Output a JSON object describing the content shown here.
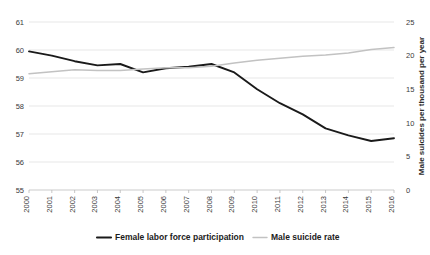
{
  "chart_data": {
    "type": "line",
    "title": "",
    "xlabel": "",
    "ylabel": "",
    "y2label": "Male suicides per thousand per year",
    "grid": true,
    "legend_position": "bottom",
    "categories": [
      "2000",
      "2001",
      "2002",
      "2003",
      "2004",
      "2005",
      "2006",
      "2007",
      "2008",
      "2009",
      "2010",
      "2011",
      "2012",
      "2013",
      "2014",
      "2015",
      "2016"
    ],
    "ylim": [
      55,
      61
    ],
    "yticks": [
      "55",
      "56",
      "57",
      "58",
      "59",
      "60",
      "61"
    ],
    "y2lim": [
      0,
      25
    ],
    "y2ticks": [
      "0",
      "5",
      "10",
      "15",
      "20",
      "25"
    ],
    "series": [
      {
        "name": "Female labor force participation",
        "axis": "left",
        "color": "#1a1a1a",
        "values": [
          59.95,
          59.8,
          59.6,
          59.45,
          59.5,
          59.2,
          59.35,
          59.4,
          59.5,
          59.2,
          58.6,
          58.1,
          57.7,
          57.2,
          56.95,
          56.75,
          56.85
        ]
      },
      {
        "name": "Male suicide rate",
        "axis": "right",
        "color": "#c2c2c2",
        "values": [
          17.3,
          17.6,
          17.9,
          17.8,
          17.8,
          18.0,
          18.2,
          18.2,
          18.4,
          18.9,
          19.3,
          19.6,
          19.9,
          20.1,
          20.4,
          20.9,
          21.2
        ]
      }
    ]
  },
  "legend": {
    "items": [
      {
        "label": "Female labor force participation",
        "color": "#1a1a1a",
        "style": "thick"
      },
      {
        "label": "Male suicide rate",
        "color": "#c2c2c2",
        "style": "thin"
      }
    ]
  }
}
